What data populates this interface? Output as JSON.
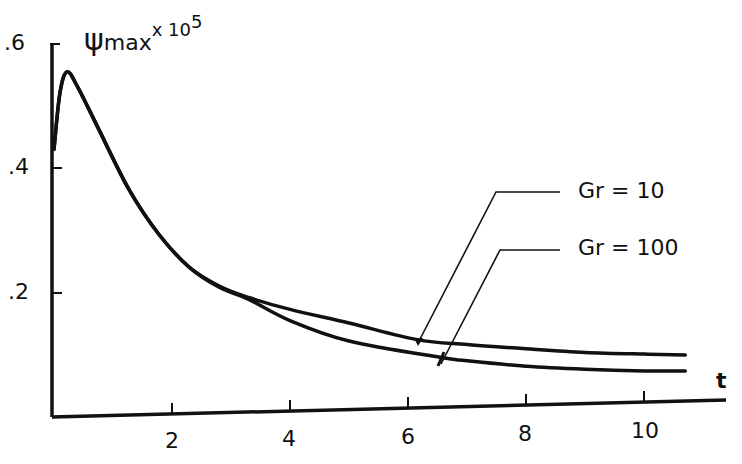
{
  "chart_data": {
    "type": "line",
    "title": "",
    "xlabel": "t",
    "ylabel": "ψ max × 10^5",
    "ylabel_parts": {
      "symbol": "ψ",
      "subscript": "max",
      "multiplier": "x 10",
      "exponent": "5"
    },
    "xlim": [
      0,
      11.3
    ],
    "ylim": [
      0,
      0.6
    ],
    "x_ticks": [
      2,
      4,
      6,
      8,
      10
    ],
    "x_tick_labels": [
      "2",
      "4",
      "6",
      "8",
      "10"
    ],
    "y_ticks": [
      0.2,
      0.4,
      0.6
    ],
    "y_tick_labels": [
      ".2",
      ".4",
      ".6"
    ],
    "grid": false,
    "legend_position": "annotations with leader lines, upper right",
    "series": [
      {
        "name": "Gr = 10",
        "x": [
          0.0,
          0.1,
          0.22,
          0.4,
          0.76,
          1.27,
          1.78,
          2.29,
          2.8,
          3.3,
          4.0,
          5.0,
          6.15,
          7.0,
          8.0,
          9.0,
          10.0,
          10.7
        ],
        "values": [
          0.43,
          0.52,
          0.554,
          0.53,
          0.461,
          0.364,
          0.291,
          0.238,
          0.207,
          0.188,
          0.168,
          0.145,
          0.117,
          0.108,
          0.1,
          0.093,
          0.089,
          0.087
        ]
      },
      {
        "name": "Gr = 100",
        "x": [
          0.0,
          0.1,
          0.22,
          0.4,
          0.76,
          1.27,
          1.78,
          2.29,
          2.8,
          3.3,
          4.0,
          5.0,
          6.54,
          7.0,
          8.0,
          9.0,
          10.0,
          10.7
        ],
        "values": [
          0.43,
          0.52,
          0.554,
          0.53,
          0.461,
          0.364,
          0.291,
          0.238,
          0.205,
          0.185,
          0.15,
          0.116,
          0.088,
          0.082,
          0.072,
          0.066,
          0.062,
          0.061
        ]
      }
    ],
    "annotations": [
      {
        "text": "Gr = 10",
        "points_to_t": 6.15
      },
      {
        "text": "Gr = 100",
        "points_to_t": 6.54
      }
    ]
  },
  "labels": {
    "y_symbol": "ψ",
    "y_sub": "max",
    "y_mult": "x 10",
    "y_exp": "5",
    "x_axis": "t",
    "y_ticks": [
      ".6",
      ".4",
      ".2"
    ],
    "x_ticks": [
      "2",
      "4",
      "6",
      "8",
      "10"
    ],
    "legend_gr10": "Gr = 10",
    "legend_gr100": "Gr = 100"
  },
  "colors": {
    "ink": "#111111",
    "background": "#ffffff"
  }
}
